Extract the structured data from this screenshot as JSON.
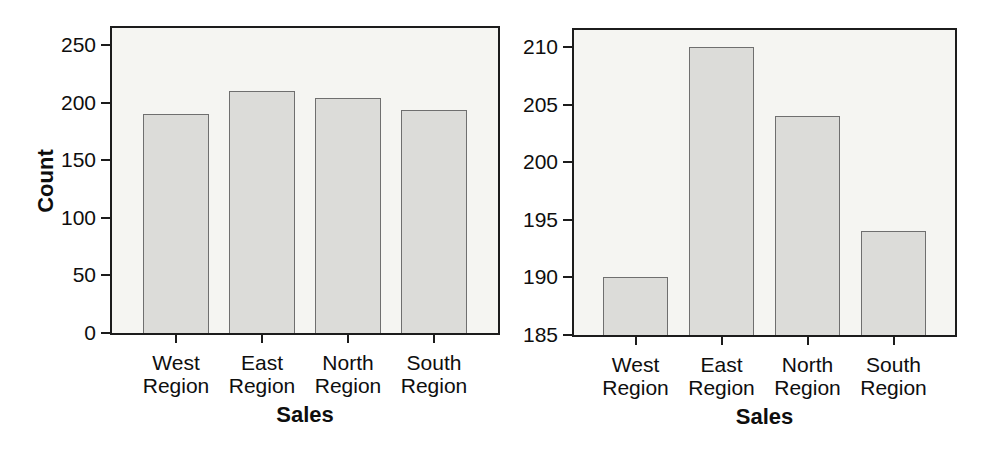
{
  "figure": {
    "colors": {
      "background": "#ffffff",
      "plot_background": "#f5f5f2",
      "bar_fill": "#dcdcd9",
      "bar_border": "#6f6f6f",
      "frame": "#1c1c1c",
      "text": "#0e0e0e"
    }
  },
  "chart_data": [
    {
      "type": "bar",
      "categories": [
        "West Region",
        "East Region",
        "North Region",
        "South Region"
      ],
      "values": [
        190,
        210,
        204,
        194
      ],
      "xlabel": "Sales",
      "ylabel": "Count",
      "ylim": [
        0,
        250
      ],
      "yticks": [
        0,
        50,
        100,
        150,
        200,
        250
      ],
      "grid": false,
      "legend_position": "none"
    },
    {
      "type": "bar",
      "categories": [
        "West Region",
        "East Region",
        "North Region",
        "South Region"
      ],
      "values": [
        190,
        210,
        204,
        194
      ],
      "xlabel": "Sales",
      "ylabel": "",
      "ylim": [
        185,
        210
      ],
      "yticks": [
        185,
        190,
        195,
        200,
        205,
        210
      ],
      "grid": false,
      "legend_position": "none"
    }
  ]
}
